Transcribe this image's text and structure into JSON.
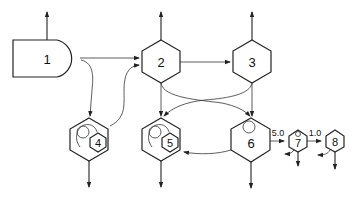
{
  "diagram": {
    "nodes": [
      {
        "id": "1",
        "label": "1",
        "shape": "d-shape"
      },
      {
        "id": "2",
        "label": "2",
        "shape": "hexagon"
      },
      {
        "id": "3",
        "label": "3",
        "shape": "hexagon"
      },
      {
        "id": "4",
        "label": "4",
        "shape": "hexagon-with-inner-recycle"
      },
      {
        "id": "5",
        "label": "5",
        "shape": "hexagon-with-inner-recycle"
      },
      {
        "id": "6",
        "label": "6",
        "shape": "hexagon-with-inner-circle"
      },
      {
        "id": "7",
        "label": "7",
        "shape": "small-hexagon"
      },
      {
        "id": "8",
        "label": "8",
        "shape": "small-hexagon"
      }
    ],
    "edges": [
      {
        "from": "1",
        "to": "2",
        "label": ""
      },
      {
        "from": "1",
        "to": "4",
        "label": ""
      },
      {
        "from": "4",
        "to": "2",
        "label": ""
      },
      {
        "from": "2",
        "to": "3",
        "label": ""
      },
      {
        "from": "2",
        "to": "5",
        "label": ""
      },
      {
        "from": "2",
        "to": "6",
        "label": ""
      },
      {
        "from": "3",
        "to": "6",
        "label": ""
      },
      {
        "from": "3",
        "to": "5",
        "label": ""
      },
      {
        "from": "6",
        "to": "5",
        "label": ""
      },
      {
        "from": "6",
        "to": "7",
        "label": "5.0"
      },
      {
        "from": "7",
        "to": "8",
        "label": "1.0"
      }
    ],
    "edge_labels": {
      "e67": "5.0",
      "e78": "1.0"
    }
  }
}
